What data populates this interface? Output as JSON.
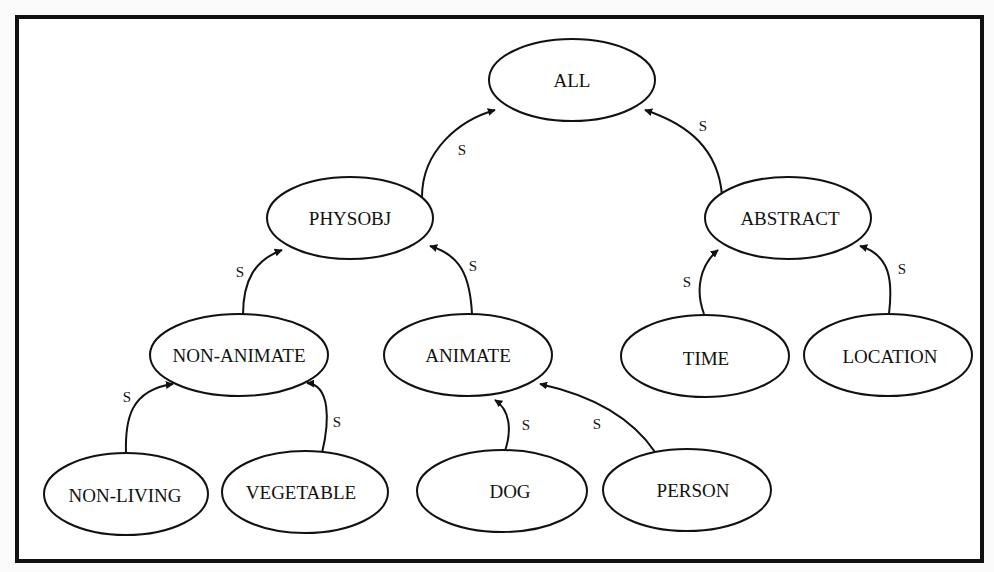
{
  "diagram": {
    "type": "semantic-hierarchy",
    "edge_label": "S",
    "nodes": {
      "all": {
        "label": "ALL",
        "cx": 572,
        "cy": 80,
        "rx": 83,
        "ry": 41
      },
      "physobj": {
        "label": "PHYSOBJ",
        "cx": 350,
        "cy": 218,
        "rx": 83,
        "ry": 41
      },
      "abstract": {
        "label": "ABSTRACT",
        "cx": 788,
        "cy": 218,
        "rx": 83,
        "ry": 41
      },
      "non_animate": {
        "label": "NON-ANIMATE",
        "cx": 239,
        "cy": 355,
        "rx": 89,
        "ry": 41
      },
      "animate": {
        "label": "ANIMATE",
        "cx": 468,
        "cy": 355,
        "rx": 84,
        "ry": 41
      },
      "time": {
        "label": "TIME",
        "cx": 705,
        "cy": 356,
        "rx": 84,
        "ry": 41
      },
      "location": {
        "label": "LOCATION",
        "cx": 888,
        "cy": 355,
        "rx": 84,
        "ry": 41
      },
      "non_living": {
        "label": "NON-LIVING",
        "cx": 126,
        "cy": 494,
        "rx": 82,
        "ry": 41
      },
      "vegetable": {
        "label": "VEGETABLE",
        "cx": 305,
        "cy": 492,
        "rx": 83,
        "ry": 41
      },
      "dog": {
        "label": "DOG",
        "cx": 502,
        "cy": 491,
        "rx": 85,
        "ry": 41
      },
      "person": {
        "label": "PERSON",
        "cx": 687,
        "cy": 490,
        "rx": 84,
        "ry": 41
      }
    },
    "edges": [
      {
        "from": "PHYSOBJ",
        "to": "ALL",
        "label": "S"
      },
      {
        "from": "ABSTRACT",
        "to": "ALL",
        "label": "S"
      },
      {
        "from": "NON-ANIMATE",
        "to": "PHYSOBJ",
        "label": "S"
      },
      {
        "from": "ANIMATE",
        "to": "PHYSOBJ",
        "label": "S"
      },
      {
        "from": "TIME",
        "to": "ABSTRACT",
        "label": "S"
      },
      {
        "from": "LOCATION",
        "to": "ABSTRACT",
        "label": "S"
      },
      {
        "from": "NON-LIVING",
        "to": "NON-ANIMATE",
        "label": "S"
      },
      {
        "from": "VEGETABLE",
        "to": "NON-ANIMATE",
        "label": "S"
      },
      {
        "from": "DOG",
        "to": "ANIMATE",
        "label": "S"
      },
      {
        "from": "PERSON",
        "to": "ANIMATE",
        "label": "S"
      }
    ],
    "edge_labels": {
      "physobj_all": "S",
      "abstract_all": "S",
      "nonanimate_physobj": "S",
      "animate_physobj": "S",
      "time_abstract": "S",
      "location_abstract": "S",
      "nonliving_nonanimate": "S",
      "vegetable_nonanimate": "S",
      "dog_animate": "S",
      "person_animate": "S"
    }
  }
}
